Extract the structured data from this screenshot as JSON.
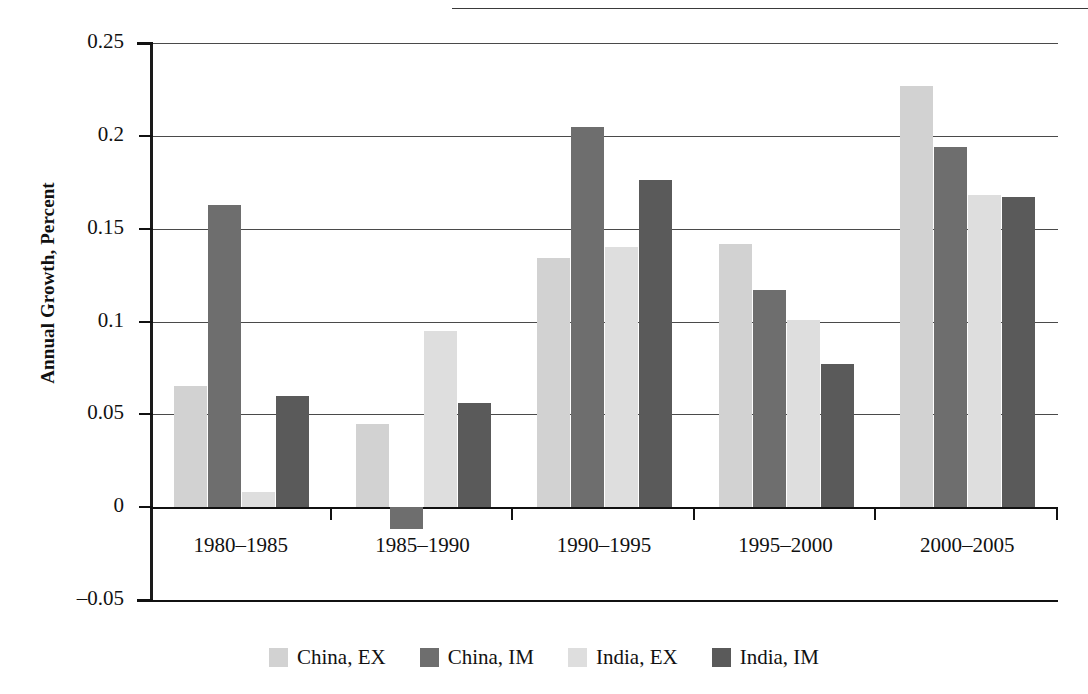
{
  "chart_data": {
    "type": "bar",
    "title": "",
    "xlabel": "",
    "ylabel": "Annual Growth, Percent",
    "ylim": [
      -0.05,
      0.25
    ],
    "yticks": [
      "0.25",
      "0.2",
      "0.15",
      "0.1",
      "0.05",
      "0",
      "–0.05"
    ],
    "ytick_values": [
      0.25,
      0.2,
      0.15,
      0.1,
      0.05,
      0,
      -0.05
    ],
    "grid": true,
    "legend_position": "bottom",
    "categories": [
      "1980–1985",
      "1985–1990",
      "1990–1995",
      "1995–2000",
      "2000–2005"
    ],
    "series": [
      {
        "name": "China, EX",
        "color": "#d2d2d2",
        "values": [
          0.065,
          0.045,
          0.134,
          0.142,
          0.227
        ]
      },
      {
        "name": "China, IM",
        "color": "#6e6e6e",
        "values": [
          0.163,
          -0.012,
          0.205,
          0.117,
          0.194
        ]
      },
      {
        "name": "India, EX",
        "color": "#dedede",
        "values": [
          0.008,
          0.095,
          0.14,
          0.101,
          0.168
        ]
      },
      {
        "name": "India, IM",
        "color": "#5a5a5a",
        "values": [
          0.06,
          0.056,
          0.176,
          0.077,
          0.167
        ]
      }
    ]
  },
  "legend": {
    "items": [
      {
        "label": "China, EX",
        "color": "#d2d2d2"
      },
      {
        "label": "China, IM",
        "color": "#6e6e6e"
      },
      {
        "label": "India, EX",
        "color": "#dedede"
      },
      {
        "label": "India, IM",
        "color": "#5a5a5a"
      }
    ]
  },
  "axis": {
    "y_title": "Annual Growth, Percent"
  }
}
